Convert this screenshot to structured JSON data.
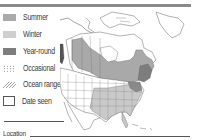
{
  "colors": {
    "topbar": "#8a8a8a",
    "summer": "#a9a9a9",
    "winter": "#c9c9c9",
    "year_round": "#7f7f7f",
    "outline": "#555555"
  },
  "legend": {
    "items": [
      {
        "key": "summer",
        "label": "Summer",
        "icon": "summer-swatch"
      },
      {
        "key": "winter",
        "label": "Winter",
        "icon": "winter-swatch"
      },
      {
        "key": "year_round",
        "label": "Year-round",
        "icon": "year-round-swatch"
      },
      {
        "key": "occasional",
        "label": "Occasional",
        "icon": "dotted-swatch"
      },
      {
        "key": "ocean_range",
        "label": "Ocean range",
        "icon": "hatched-swatch"
      },
      {
        "key": "date_seen",
        "label": "Date seen",
        "icon": "checkbox"
      }
    ]
  },
  "form": {
    "location_label": "Location"
  },
  "map": {
    "region": "North America range map"
  }
}
